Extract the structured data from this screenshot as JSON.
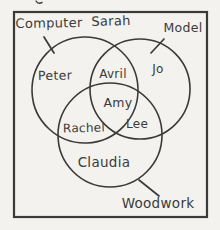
{
  "diagram": {
    "type": "venn",
    "style": "hand-drawn pencil sketch on paper",
    "sets": [
      "Computer",
      "Model",
      "Woodwork"
    ],
    "regions": {
      "computer_only": [
        "Peter"
      ],
      "model_only": [
        "Jo"
      ],
      "computer_and_model": [
        "Avril"
      ],
      "computer_and_model_and_woodwork": [
        "Amy"
      ],
      "computer_and_woodwork": [
        "Rachel"
      ],
      "model_and_woodwork": [
        "Lee"
      ],
      "woodwork_only": [
        "Claudia"
      ],
      "outside_all_sets_inside_universe": [
        "Sarah"
      ]
    }
  },
  "labels": {
    "computer": "Computer",
    "sarah": "Sarah",
    "model": "Model",
    "peter": "Peter",
    "avril": "Avril",
    "jo": "Jo",
    "amy": "Amy",
    "rachel": "Rachel",
    "lee": "Lee",
    "claudia": "Claudia",
    "woodwork": "Woodwork"
  },
  "colors": {
    "ink": "#3a3a3a",
    "paper": "#f3f2ef"
  }
}
